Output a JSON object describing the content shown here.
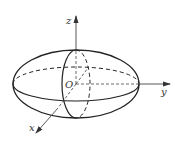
{
  "diagram": {
    "type": "ellipsoid-3d-axes",
    "stroke_color": "#222222",
    "axis_color": "#444444",
    "labels": {
      "z_axis": "z",
      "y_axis": "y",
      "x_axis": "x",
      "origin": "O"
    }
  }
}
